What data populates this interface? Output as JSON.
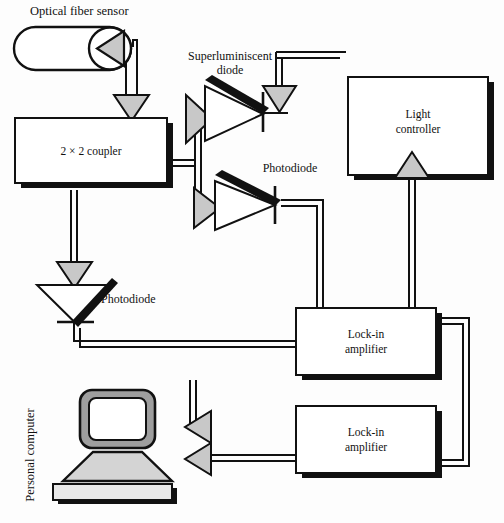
{
  "figure": {
    "background_color": "#fdfdfd",
    "line_color": "#111111",
    "shadow_color": "#111111",
    "arrow_fill": "#c8c8c8",
    "device_fill": "#ffffff"
  },
  "labels": {
    "optical_fiber_sensor": "Optical fiber sensor",
    "superluminiscent_diode_line1": "Superluminiscent",
    "superluminiscent_diode_line2": "diode",
    "coupler": "2 × 2 coupler",
    "photodiode_right": "Photodiode",
    "photodiode_left": "Photodiode",
    "light_controller_line1": "Light",
    "light_controller_line2": "controller",
    "lockin_amplifier_top_line1": "Lock-in",
    "lockin_amplifier_top_line2": "amplifier",
    "lockin_amplifier_bottom_line1": "Lock-in",
    "lockin_amplifier_bottom_line2": "amplifier",
    "personal_computer": "Personal computer"
  },
  "components": [
    {
      "id": "optical-fiber-sensor",
      "type": "capsule-sensor",
      "label": "Optical fiber sensor"
    },
    {
      "id": "coupler",
      "type": "box",
      "label": "2 × 2 coupler"
    },
    {
      "id": "superluminiscent-diode",
      "type": "diode-triangle",
      "label": "Superluminiscent diode",
      "orientation": "right"
    },
    {
      "id": "photodiode-right",
      "type": "diode-triangle",
      "label": "Photodiode",
      "orientation": "right"
    },
    {
      "id": "photodiode-left",
      "type": "diode-triangle",
      "label": "Photodiode",
      "orientation": "down"
    },
    {
      "id": "light-controller",
      "type": "box",
      "label": "Light controller"
    },
    {
      "id": "lockin-amplifier-top",
      "type": "box",
      "label": "Lock-in amplifier"
    },
    {
      "id": "lockin-amplifier-bottom",
      "type": "box",
      "label": "Lock-in amplifier"
    },
    {
      "id": "personal-computer",
      "type": "computer",
      "label": "Personal computer"
    }
  ],
  "connections": [
    {
      "from": "optical-fiber-sensor",
      "to": "coupler",
      "arrow": "down"
    },
    {
      "from": "coupler",
      "to": "superluminiscent-diode",
      "arrow": "right"
    },
    {
      "from": "coupler",
      "to": "photodiode-right",
      "arrow": "right"
    },
    {
      "from": "coupler",
      "to": "photodiode-left",
      "arrow": "down"
    },
    {
      "from": "light-controller",
      "to": "superluminiscent-diode",
      "arrow": "down"
    },
    {
      "from": "lockin-amplifier-top",
      "to": "light-controller",
      "arrow": "up"
    },
    {
      "from": "photodiode-right",
      "to": "lockin-amplifier-top",
      "arrow": "none"
    },
    {
      "from": "photodiode-left",
      "to": "lockin-amplifier-top",
      "arrow": "none"
    },
    {
      "from": "lockin-amplifier-top",
      "to": "lockin-amplifier-bottom",
      "arrow": "none"
    },
    {
      "from": "lockin-amplifier-top",
      "to": "personal-computer",
      "arrow": "left"
    },
    {
      "from": "lockin-amplifier-bottom",
      "to": "personal-computer",
      "arrow": "left"
    }
  ]
}
